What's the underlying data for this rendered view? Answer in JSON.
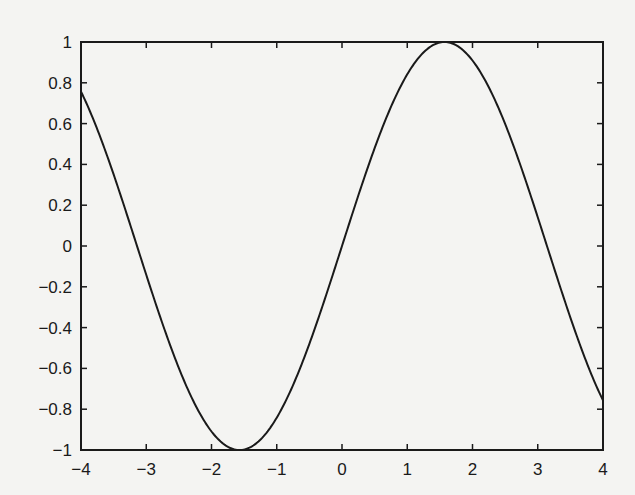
{
  "chart_data": {
    "type": "line",
    "title": "",
    "xlabel": "",
    "ylabel": "",
    "xlim": [
      -4,
      4
    ],
    "ylim": [
      -1,
      1
    ],
    "grid": false,
    "legend": null,
    "series": [
      {
        "name": "sin(x)",
        "function": "sin",
        "x": [
          -4,
          -3.5,
          -3,
          -2.5,
          -2,
          -1.5708,
          -1,
          -0.5,
          0,
          0.5,
          1,
          1.5708,
          2,
          2.5,
          3,
          3.5,
          4
        ],
        "values": [
          0.757,
          0.351,
          -0.141,
          -0.598,
          -0.909,
          -1.0,
          -0.841,
          -0.479,
          0,
          0.479,
          0.841,
          1.0,
          0.909,
          0.598,
          0.141,
          -0.351,
          -0.757
        ],
        "color": "#1a1a1a"
      }
    ],
    "xticks": [
      -4,
      -3,
      -2,
      -1,
      0,
      1,
      2,
      3,
      4
    ],
    "xtick_labels": [
      "−4",
      "−3",
      "−2",
      "−1",
      "0",
      "1",
      "2",
      "3",
      "4"
    ],
    "yticks": [
      -1,
      -0.8,
      -0.6,
      -0.4,
      -0.2,
      0,
      0.2,
      0.4,
      0.6,
      0.8,
      1
    ],
    "ytick_labels": [
      "−1",
      "−0.8",
      "−0.6",
      "−0.4",
      "−0.2",
      "0",
      "0.2",
      "0.4",
      "0.6",
      "0.8",
      "1"
    ]
  },
  "layout": {
    "plot_left": 81,
    "plot_top": 42,
    "plot_right": 603,
    "plot_bottom": 450,
    "axis_color": "#1a1a1a",
    "background": "#f4f4f2"
  }
}
